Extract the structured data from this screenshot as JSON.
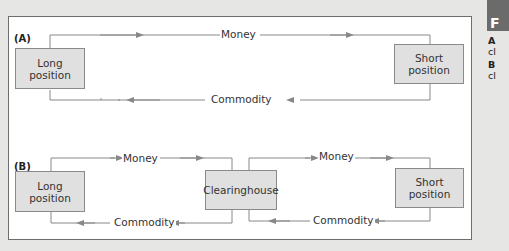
{
  "diagram": {
    "panel_a": {
      "label": "(A)",
      "long_box": {
        "line1": "Long",
        "line2": "position"
      },
      "short_box": {
        "line1": "Short",
        "line2": "position"
      },
      "money_label": "Money",
      "commodity_label": "Commodity"
    },
    "panel_b": {
      "label": "(B)",
      "long_box": {
        "line1": "Long",
        "line2": "position"
      },
      "clearinghouse_box": "Clearinghouse",
      "short_box": {
        "line1": "Short",
        "line2": "position"
      },
      "money_label_left": "Money",
      "money_label_right": "Money",
      "commodity_label_left": "Commodity",
      "commodity_label_right": "Commodity"
    }
  },
  "sidebar": {
    "header_letter": "F",
    "items": [
      {
        "key": "A",
        "text": "cl"
      },
      {
        "key": "B",
        "text": "cl"
      }
    ]
  },
  "colors": {
    "background": "#e6e6e4",
    "panel": "#ffffff",
    "box_fill": "#e0e0e0",
    "line": "#888888",
    "sidebar_header": "#6b6b6b"
  }
}
